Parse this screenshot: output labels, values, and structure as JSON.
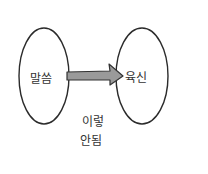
{
  "diagram": {
    "left_node": {
      "label": "말씀"
    },
    "right_node": {
      "label": "육신"
    },
    "arrow": {
      "fill": "#9a9a9a",
      "stroke": "#333333"
    },
    "caption": {
      "line1": "이렇",
      "line2": "안됨"
    },
    "colors": {
      "stroke": "#2b2b2b",
      "background": "#ffffff"
    }
  }
}
